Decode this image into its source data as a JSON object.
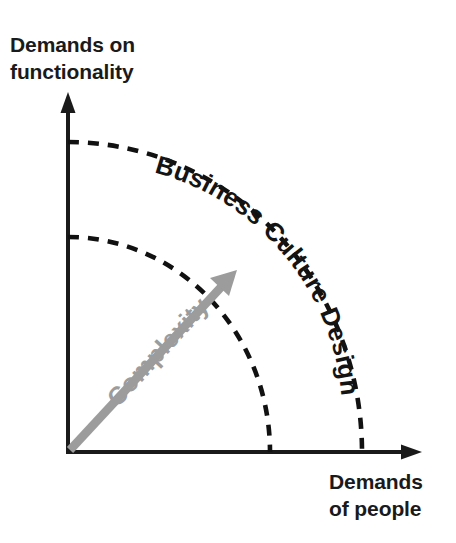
{
  "figure": {
    "kind": "quadrant-arc-diagram",
    "background_color": "#ffffff",
    "ink_color": "#1a1a1a",
    "accent_gray": "#9c9c9c"
  },
  "axes": {
    "y_axis": {
      "label_line1": "Demands on",
      "label_line2": "functionality",
      "icon": "arrow-up-icon"
    },
    "x_axis": {
      "label_line1": "Demands",
      "label_line2": "of people",
      "icon": "arrow-right-icon"
    }
  },
  "arcs": [
    {
      "id": "inner-arc",
      "style": "dashed"
    },
    {
      "id": "outer-arc",
      "style": "dashed"
    }
  ],
  "labels": {
    "curved_zone": "Business Culture Design",
    "complexity": "Complexity"
  },
  "complexity_arrow": {
    "label": "Complexity",
    "color": "#9c9c9c",
    "direction": "up-right",
    "icon": "arrow-up-right-icon"
  }
}
